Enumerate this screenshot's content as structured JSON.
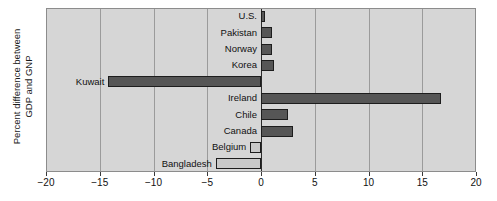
{
  "chart_data": {
    "type": "bar",
    "orientation": "horizontal",
    "title": "",
    "xlabel": "",
    "ylabel": "Percent difference between GDP and GNP",
    "ylabel_lines": [
      "Percent difference between",
      "GDP and GNP"
    ],
    "xlim": [
      -20,
      20
    ],
    "xticks": [
      -20,
      -15,
      -10,
      -5,
      0,
      5,
      10,
      15,
      20
    ],
    "xticklabels": [
      "−20",
      "−15",
      "−10",
      "−5",
      "0",
      "5",
      "10",
      "15",
      "20"
    ],
    "grid": true,
    "grid_axis": "x",
    "legend": false,
    "categories": [
      "U.S.",
      "Pakistan",
      "Norway",
      "Korea",
      "Kuwait",
      "Ireland",
      "Chile",
      "Canada",
      "Belgium",
      "Bangladesh"
    ],
    "values": [
      0.4,
      1.0,
      1.0,
      1.2,
      -14.2,
      16.7,
      2.5,
      3.0,
      -1.0,
      -4.2
    ],
    "bar_colors": [
      "#565656",
      "#565656",
      "#565656",
      "#565656",
      "#565656",
      "#565656",
      "#565656",
      "#565656",
      "#c9c9c9",
      "#c9c9c9"
    ],
    "plot_background": "#d6d6d6",
    "bar_edge_color": "#1d1d1d",
    "gridline_color": "#9b9b9b",
    "zero_line_color": "#2b2b2b"
  },
  "axis": {
    "y_title_line1": "Percent difference between",
    "y_title_line2": "GDP and GNP"
  }
}
